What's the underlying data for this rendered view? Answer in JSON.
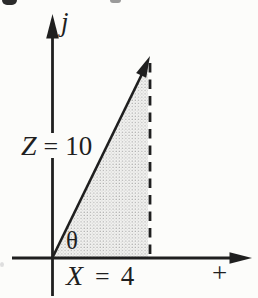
{
  "figure": {
    "type": "phasor-vector-diagram",
    "background_color": "#fcfcfa",
    "ink_color": "#1f1f1f",
    "shade_base_color": "#f2f2f0",
    "shade_dot_color": "#9c9c9c",
    "labels": {
      "y_axis": "j",
      "x_axis_polarity": "+",
      "angle": "θ",
      "vector": {
        "name": "Z",
        "equals": "=",
        "value": "10"
      },
      "x_component": {
        "name": "X",
        "equals": "=",
        "value": "4"
      }
    }
  }
}
